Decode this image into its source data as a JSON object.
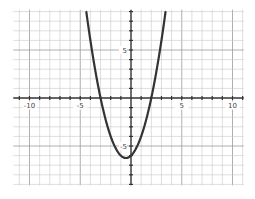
{
  "chart_data": {
    "type": "line",
    "title": "",
    "xlabel": "",
    "ylabel": "",
    "function": "y = x^2 + x - 6",
    "xlim": [
      -11.6,
      11.1
    ],
    "ylim": [
      -9.1,
      9.2
    ],
    "grid": true,
    "x_tick_labels": [
      {
        "value": -10,
        "label": "-10"
      },
      {
        "value": -5,
        "label": "-5"
      },
      {
        "value": 5,
        "label": "5"
      },
      {
        "value": 10,
        "label": "10"
      }
    ],
    "y_tick_labels": [
      {
        "value": 5,
        "label": "5"
      },
      {
        "value": -5,
        "label": "-5"
      }
    ],
    "series": [
      {
        "name": "parabola",
        "color": "#333333",
        "x": [
          -4.4,
          -4,
          -3.5,
          -3,
          -2.5,
          -2,
          -1.5,
          -1,
          -0.5,
          0,
          0.5,
          1,
          1.5,
          2,
          2.5,
          3,
          3.4
        ],
        "y": [
          9.0,
          6,
          2.75,
          0,
          -2.25,
          -4,
          -5.25,
          -6,
          -6.25,
          -6,
          -5.25,
          -4,
          -2.25,
          0,
          2.75,
          6,
          8.96
        ]
      }
    ],
    "key_points": {
      "vertex": [
        -0.5,
        -6.25
      ],
      "x_intercepts": [
        -3,
        2
      ],
      "y_intercept": -6
    }
  },
  "colors": {
    "background": "#ffffff",
    "grid": "#c8c8c8",
    "axis": "#333333",
    "curve": "#333333"
  }
}
